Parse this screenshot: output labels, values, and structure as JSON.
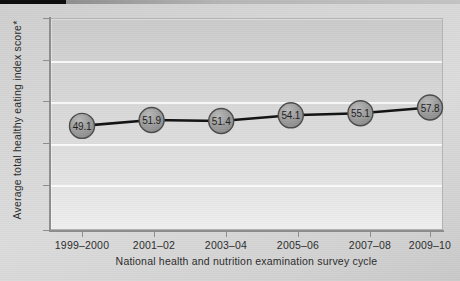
{
  "chart_data": {
    "type": "line",
    "title": "",
    "xlabel": "National health and nutrition examination survey cycle",
    "ylabel": "Average total healthy eating index score*",
    "categories": [
      "1999–2000",
      "2001–02",
      "2003–04",
      "2005–06",
      "2007–08",
      "2009–10"
    ],
    "values": [
      49.1,
      51.4,
      51.4,
      54.1,
      55.1,
      57.8
    ],
    "point_labels": [
      "49.1",
      "51.9",
      "51.4",
      "54.1",
      "55.1",
      "57.8"
    ],
    "series": [
      {
        "name": "Average total healthy eating index score",
        "values": [
          49.1,
          51.9,
          51.4,
          54.1,
          55.1,
          57.8
        ]
      }
    ],
    "ylim": [
      0,
      100
    ],
    "yticks": [
      0,
      20,
      40,
      60,
      80,
      100
    ],
    "ytick_labels": [
      "0",
      "20",
      "40",
      "60",
      "80",
      "100"
    ],
    "grid": "horizontal",
    "legend": "none",
    "marker": "circle",
    "colors": {
      "line": "#111111",
      "marker_fill": "#9a9a9a",
      "marker_edge": "#4a4a4a",
      "gridline": "#ffffff",
      "axis": "#8d8d8d",
      "text": "#2b2b2b",
      "plot_background_top": "#cbcbcb",
      "plot_background_bottom": "#efefef",
      "figure_background": "#d4d4d4"
    }
  }
}
